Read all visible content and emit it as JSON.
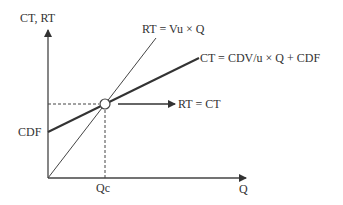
{
  "diagram": {
    "type": "break-even chart",
    "y_axis_label": "CT, RT",
    "x_axis_label": "Q",
    "revenue_line_label": "RT = Vu × Q",
    "cost_line_label": "CT = CDV/u × Q + CDF",
    "fixed_cost_label": "CDF",
    "breakeven_quantity_label": "Qc",
    "breakeven_point_label": "RT = CT",
    "colors": {
      "line": "#333333",
      "background": "#ffffff"
    }
  }
}
